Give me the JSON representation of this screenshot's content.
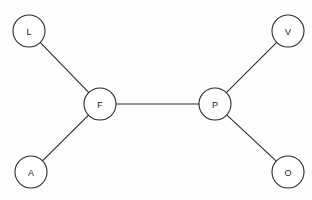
{
  "diagram": {
    "type": "node-link-diagram",
    "layout": "free-form",
    "width": 312,
    "height": 200,
    "background_color": "#fdfdfd",
    "node_fill_color": "#ffffff",
    "node_stroke_color": "#2b2b2b",
    "edge_color": "#2b2b2b",
    "label_color": "#1a1a1a",
    "node_radius": 16,
    "nodes": [
      {
        "id": "L",
        "label": "L",
        "cx": 29,
        "cy": 31
      },
      {
        "id": "V",
        "label": "V",
        "cx": 288,
        "cy": 31
      },
      {
        "id": "F",
        "label": "F",
        "cx": 100,
        "cy": 104
      },
      {
        "id": "P",
        "label": "P",
        "cx": 215,
        "cy": 104
      },
      {
        "id": "A",
        "label": "A",
        "cx": 31,
        "cy": 172
      },
      {
        "id": "O",
        "label": "O",
        "cx": 288,
        "cy": 172
      }
    ],
    "edges": [
      {
        "source": "L",
        "target": "F"
      },
      {
        "source": "A",
        "target": "F"
      },
      {
        "source": "F",
        "target": "P"
      },
      {
        "source": "P",
        "target": "V"
      },
      {
        "source": "P",
        "target": "O"
      }
    ]
  }
}
